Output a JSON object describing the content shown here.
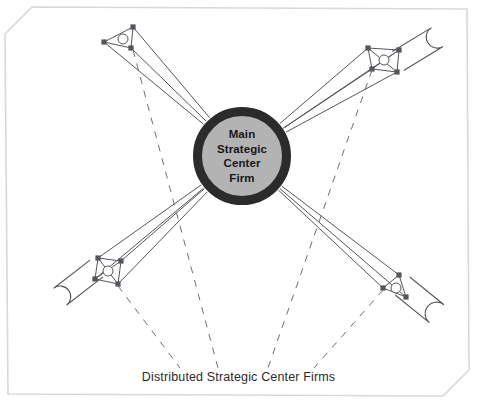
{
  "diagram": {
    "title_lines": [
      "Main",
      "Strategic",
      "Center",
      "Firm"
    ],
    "caption": "Distributed Strategic Center Firms",
    "colors": {
      "hub_fill": "#b3b3b3",
      "hub_stroke": "#2b2b2e",
      "line": "#55555c",
      "dashed_line": "#6e6e75",
      "node_fill": "#55555c",
      "frame": "#d8d8d8",
      "background": "#ffffff",
      "text": "#17171a"
    },
    "hub": {
      "center_x": 242,
      "center_y": 156,
      "radius": 49,
      "ring_width": 9
    },
    "clusters": [
      {
        "name": "top-left",
        "nodes": [
          {
            "x": 104,
            "y": 42
          },
          {
            "x": 133,
            "y": 27
          },
          {
            "x": 131,
            "y": 48
          }
        ],
        "inner_circle": {
          "x": 123,
          "y": 39,
          "r": 5
        },
        "loop": {
          "x1": 104,
          "y1": 42,
          "x2": 131,
          "y2": 48,
          "width": 0
        },
        "spokes": 3
      },
      {
        "name": "top-right",
        "nodes": [
          {
            "x": 368,
            "y": 48
          },
          {
            "x": 399,
            "y": 50
          },
          {
            "x": 372,
            "y": 69
          },
          {
            "x": 397,
            "y": 72
          }
        ],
        "inner_circle": {
          "x": 384,
          "y": 60,
          "r": 5
        },
        "loop": {
          "x1": 399,
          "y1": 50,
          "x2": 397,
          "y2": 72,
          "width": 46
        },
        "spokes": 4
      },
      {
        "name": "bottom-left",
        "nodes": [
          {
            "x": 98,
            "y": 258
          },
          {
            "x": 121,
            "y": 261
          },
          {
            "x": 95,
            "y": 279
          },
          {
            "x": 118,
            "y": 284
          }
        ],
        "inner_circle": {
          "x": 108,
          "y": 271,
          "r": 5
        },
        "loop": {
          "x1": 98,
          "y1": 258,
          "x2": 95,
          "y2": 279,
          "width": 46
        },
        "spokes": 4
      },
      {
        "name": "bottom-right",
        "nodes": [
          {
            "x": 383,
            "y": 288
          },
          {
            "x": 399,
            "y": 275
          },
          {
            "x": 406,
            "y": 297
          }
        ],
        "inner_circle": {
          "x": 396,
          "y": 288,
          "r": 5
        },
        "loop": {
          "x1": 399,
          "y1": 275,
          "x2": 406,
          "y2": 297,
          "width": 44
        },
        "spokes": 3
      }
    ],
    "dashed_paths": [
      {
        "from_x": 133,
        "from_y": 50,
        "to_x": 218,
        "to_y": 368
      },
      {
        "from_x": 118,
        "from_y": 286,
        "to_x": 180,
        "to_y": 368
      },
      {
        "from_x": 372,
        "from_y": 70,
        "to_x": 268,
        "to_y": 368
      },
      {
        "from_x": 383,
        "from_y": 290,
        "to_x": 314,
        "to_y": 368
      }
    ],
    "frame": {
      "chamfer": 26,
      "inset_left": 6,
      "inset_top": 8,
      "inset_right": 8,
      "inset_bottom": 8
    }
  }
}
